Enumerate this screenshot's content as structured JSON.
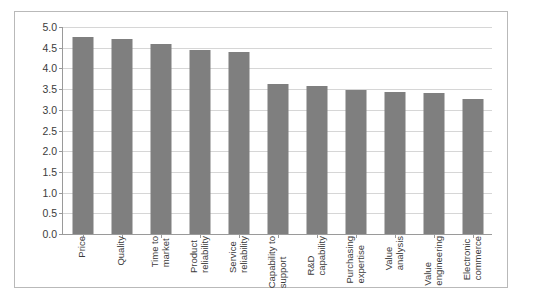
{
  "chart_data": {
    "type": "bar",
    "title": "",
    "subtitle": "",
    "xlabel": "",
    "ylabel": "",
    "ylim": [
      0.0,
      5.0
    ],
    "ytick_step": 0.5,
    "ytick_labels": [
      "0.0",
      "0.5",
      "1.0",
      "1.5",
      "2.0",
      "2.5",
      "3.0",
      "3.5",
      "4.0",
      "4.5",
      "5.0"
    ],
    "ytick_values": [
      0.0,
      0.5,
      1.0,
      1.5,
      2.0,
      2.5,
      3.0,
      3.5,
      4.0,
      4.5,
      5.0
    ],
    "grid": "horizontal",
    "legend": "none",
    "bar_color": "#7f7f7f",
    "gridline_color": "#d6d6d6",
    "axis_color": "#9a9a9a",
    "label_rotation": -90,
    "categories": [
      "Price",
      "Quality",
      "Time to market",
      "Product reliability",
      "Service reliability",
      "Capability to support",
      "R&D capability",
      "Purchasing expertise",
      "Value analysis",
      "Value engineering",
      "Electronic commerce"
    ],
    "category_lines": [
      [
        "Price"
      ],
      [
        "Quality"
      ],
      [
        "Time to",
        "market"
      ],
      [
        "Product",
        "reliability"
      ],
      [
        "Service",
        "reliability"
      ],
      [
        "Capability to",
        "support"
      ],
      [
        "R&D",
        "capability"
      ],
      [
        "Purchasing",
        "expertise"
      ],
      [
        "Value",
        "analysis"
      ],
      [
        "Value",
        "engineering"
      ],
      [
        "Electronic",
        "commerce"
      ]
    ],
    "values": [
      4.75,
      4.7,
      4.6,
      4.45,
      4.4,
      3.62,
      3.58,
      3.48,
      3.42,
      3.4,
      3.25
    ]
  }
}
